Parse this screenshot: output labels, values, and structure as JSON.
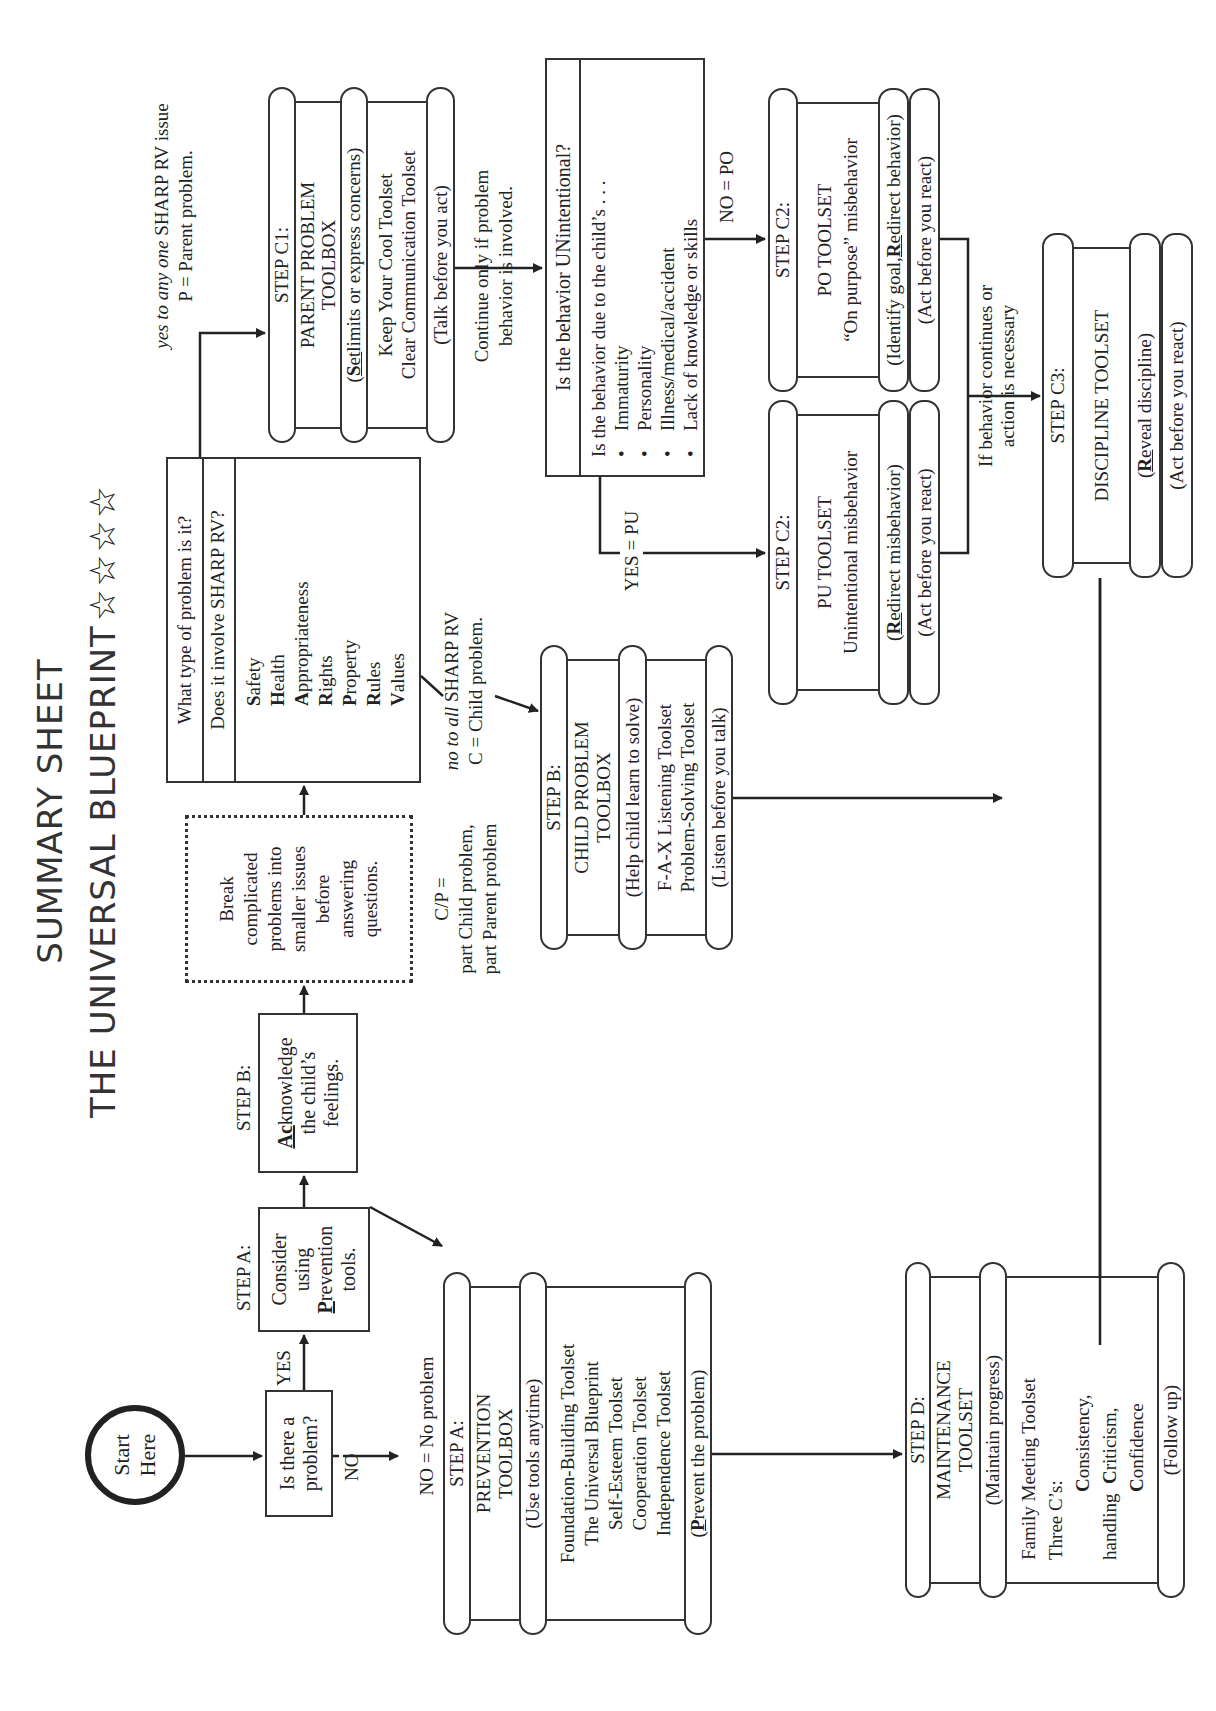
{
  "title": {
    "line1": "SUMMARY SHEET",
    "line2": "THE UNIVERSAL BLUEPRINT",
    "stars": "☆☆☆☆"
  },
  "start": {
    "line1": "Start",
    "line2": "Here"
  },
  "question_problem": {
    "line1": "Is there a",
    "line2": "problem?",
    "yes": "YES",
    "no": "NO"
  },
  "step_a_consider": {
    "label": "STEP A:",
    "lines": [
      "Consider",
      "using"
    ],
    "prevention_first": "P",
    "prevention_rest": "revention",
    "last": "tools."
  },
  "step_b_acknowledge": {
    "label": "STEP B:",
    "ack_first": "Ac",
    "ack_rest": "knowledge",
    "lines": [
      "the child’s",
      "feelings."
    ]
  },
  "break_box": {
    "lines": [
      "Break",
      "complicated",
      "problems into",
      "smaller issues",
      "before",
      "answering",
      "questions."
    ]
  },
  "sharp_box": {
    "q1": "What type of problem is it?",
    "q2": "Does it involve SHARP RV?",
    "items": [
      {
        "initial": "S",
        "rest": "afety"
      },
      {
        "initial": "H",
        "rest": "ealth"
      },
      {
        "initial": "A",
        "rest": "ppropriateness"
      },
      {
        "initial": "R",
        "rest": "ights"
      },
      {
        "initial": "P",
        "rest": "roperty"
      },
      {
        "initial": "R",
        "rest": "ules"
      },
      {
        "initial": "V",
        "rest": "alues"
      }
    ]
  },
  "parent_note": {
    "yes_to": "yes to",
    "any_one": "any one",
    "rest": " SHARP RV issue",
    "line2": "P = Parent problem."
  },
  "child_note": {
    "no_to_all": "no to all",
    "rest": " SHARP RV",
    "line2": "C = Child problem."
  },
  "cp_note": {
    "line1": "C/P =",
    "line2": "part Child problem,",
    "line3": "part Parent problem"
  },
  "no_problem_note": "NO = No problem",
  "step_c1": {
    "header": "STEP C1:",
    "title1": "PARENT PROBLEM",
    "title2": "TOOLBOX",
    "sub_first": "S",
    "sub_second": "et",
    "sub_rest": " limits or express concerns)",
    "tools": [
      "Keep Your Cool Toolset",
      "Clear Communication Toolset"
    ],
    "footer": "(Talk before you act)"
  },
  "continue_note": {
    "line1": "Continue only if problem",
    "line2": "behavior is involved."
  },
  "unintentional_box": {
    "header": "Is the behavior UNintentional?",
    "lead": "Is the behavior due to the child’s . . .",
    "bullets": [
      "Immaturity",
      "Personality",
      "Illness/medical/accident",
      "Lack of knowledge or skills"
    ]
  },
  "yes_pu": "YES = PU",
  "no_po": "NO = PO",
  "step_b_child": {
    "header": "STEP B:",
    "title1": "CHILD PROBLEM",
    "title2": "TOOLBOX",
    "sub": "(Help child learn to solve)",
    "tools": [
      "F-A-X Listening Toolset",
      "Problem-Solving Toolset"
    ],
    "footer": "(Listen before you talk)"
  },
  "step_c2_pu": {
    "header": "STEP C2:",
    "title": "PU TOOLSET",
    "desc": "Unintentional misbehavior",
    "sub_first": "R",
    "sub_second": "e",
    "sub_rest": "direct misbehavior)",
    "footer": "(Act before you react)"
  },
  "step_c2_po": {
    "header": "STEP C2:",
    "title": "PO TOOLSET",
    "desc": "“On purpose” misbehavior",
    "sub_pre": "(Identify goal, ",
    "sub_first": "R",
    "sub_second": "e",
    "sub_rest": "direct behavior)",
    "footer": "(Act before you react)"
  },
  "continues_note": {
    "line1": "If behavior continues or",
    "line2": "action is necessary"
  },
  "step_c3": {
    "header": "STEP C3:",
    "title": "DISCIPLINE TOOLSET",
    "sub_first": "R",
    "sub_second": "e",
    "sub_rest": "veal discipline)",
    "footer": "(Act before you react)"
  },
  "step_a_prevention": {
    "header": "STEP A:",
    "title1": "PREVENTION",
    "title2": "TOOLBOX",
    "sub": "(Use tools anytime)",
    "tools": [
      "Foundation-Building Toolset",
      "The Universal Blueprint",
      "Self-Esteem Toolset",
      "Cooperation Toolset",
      "Independence Toolset"
    ],
    "footer_first": "P",
    "footer_rest": "revent the problem)"
  },
  "step_d": {
    "header": "STEP D:",
    "title1": "MAINTENANCE",
    "title2": "TOOLSET",
    "sub": "(Maintain progress)",
    "line1": "Family Meeting Toolset",
    "line2": "Three C’s:",
    "c1_initial": "C",
    "c1_rest": "onsistency,",
    "handling": "handling",
    "c2_initial": "C",
    "c2_rest": "riticism,",
    "c3_initial": "C",
    "c3_rest": "onfidence",
    "footer": "(Follow up)"
  }
}
